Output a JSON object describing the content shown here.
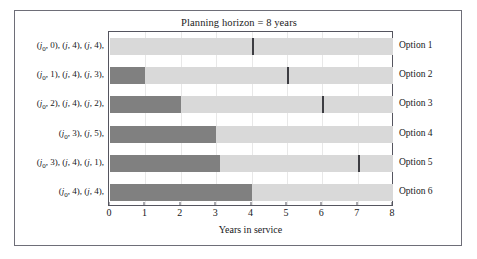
{
  "figure": {
    "title": "Planning horizon = 8 years",
    "xlabel": "Years in service",
    "background": "#ffffff",
    "border_color": "#6e6e78",
    "colors": {
      "dark_segment": "#808080",
      "light_segment": "#d9d9d9",
      "marker": "#3d3d42",
      "gridline": "#e8e8e8",
      "text": "#17171a"
    }
  },
  "axis": {
    "ticks": [
      "0",
      "1",
      "2",
      "3",
      "4",
      "5",
      "6",
      "7",
      "8"
    ],
    "min": 0,
    "max": 8
  },
  "rows": [
    {
      "left_label": "(j₀, 0), (j, 4), (j, 4),",
      "right_label": "Option 1",
      "dark_end": 0,
      "marker": 4
    },
    {
      "left_label": "(j₀, 1), (j, 4), (j, 3),",
      "right_label": "Option 2",
      "dark_end": 1,
      "marker": 5
    },
    {
      "left_label": "(j₀, 2), (j, 4), (j, 2),",
      "right_label": "Option 3",
      "dark_end": 2,
      "marker": 6
    },
    {
      "left_label": "(j₀, 3), (j, 5),",
      "right_label": "Option 4",
      "dark_end": 3,
      "marker": null
    },
    {
      "left_label": "(j₀, 3), (j, 4), (j, 1),",
      "right_label": "Option 5",
      "dark_end": 3.1,
      "marker": 7
    },
    {
      "left_label": "(j₀, 4), (j, 4),",
      "right_label": "Option 6",
      "dark_end": 4,
      "marker": null
    }
  ],
  "chart_data": {
    "type": "bar",
    "title": "Planning horizon = 8 years",
    "xlabel": "Years in service",
    "ylabel": "",
    "xlim": [
      0,
      8
    ],
    "orientation": "horizontal",
    "grid": true,
    "legend": "none",
    "xticks": [
      0,
      1,
      2,
      3,
      4,
      5,
      6,
      7,
      8
    ],
    "categories": [
      "Option 1",
      "Option 2",
      "Option 3",
      "Option 4",
      "Option 5",
      "Option 6"
    ],
    "category_detail_labels": [
      "(j₀, 0), (j, 4), (j, 4),",
      "(j₀, 1), (j, 4), (j, 3),",
      "(j₀, 2), (j, 4), (j, 2),",
      "(j₀, 3), (j, 5),",
      "(j₀, 3), (j, 4), (j, 1),",
      "(j₀, 4), (j, 4),"
    ],
    "series": [
      {
        "name": "Existing asset service (dark)",
        "color": "#808080",
        "values": [
          0,
          1,
          2,
          3,
          3.1,
          4
        ]
      },
      {
        "name": "Replacement asset service (light)",
        "color": "#d9d9d9",
        "values": [
          8,
          7,
          6,
          5,
          4.9,
          4
        ]
      }
    ],
    "markers": {
      "name": "Decision point",
      "color": "#3d3d42",
      "values": [
        4,
        5,
        6,
        null,
        7,
        null
      ]
    }
  }
}
